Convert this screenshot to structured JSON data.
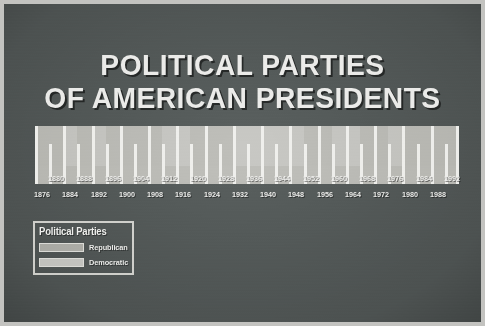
{
  "poster": {
    "title_line_1": "POLITICAL PARTIES",
    "title_line_2": "OF AMERICAN PRESIDENTS",
    "background_color": "#575d5c",
    "border_color": "#c3c3c0",
    "text_color": "#ececea"
  },
  "legend": {
    "title": "Political Parties",
    "items": [
      {
        "label": "Republican",
        "color": "#b2b2ad"
      },
      {
        "label": "Democratic",
        "color": "#c8c8c4"
      }
    ]
  },
  "axis": {
    "upper_years": [
      "1880",
      "1888",
      "1896",
      "1904",
      "1912",
      "1920",
      "1928",
      "1936",
      "1944",
      "1952",
      "1960",
      "1968",
      "1976",
      "1984",
      "1992"
    ],
    "lower_years": [
      "1876",
      "1884",
      "1892",
      "1900",
      "1908",
      "1916",
      "1924",
      "1932",
      "1940",
      "1948",
      "1956",
      "1964",
      "1972",
      "1980",
      "1988"
    ]
  },
  "chart_data": {
    "type": "bar",
    "title": "POLITICAL PARTIES OF AMERICAN PRESIDENTS",
    "xlabel": "",
    "ylabel": "",
    "orientation": "horizontal-timeline",
    "xlim": [
      1876,
      1992
    ],
    "grid": false,
    "legend_position": "bottom-left",
    "categories": [
      "1876",
      "1880",
      "1884",
      "1888",
      "1892",
      "1896",
      "1900",
      "1904",
      "1908",
      "1912",
      "1916",
      "1920",
      "1924",
      "1928",
      "1932",
      "1936",
      "1940",
      "1944",
      "1948",
      "1952",
      "1956",
      "1960",
      "1964",
      "1968",
      "1972",
      "1976",
      "1980",
      "1984",
      "1988",
      "1992"
    ],
    "values": [
      4,
      4,
      4,
      4,
      4,
      4,
      4,
      4,
      4,
      4,
      4,
      4,
      4,
      4,
      4,
      4,
      4,
      4,
      4,
      4,
      4,
      4,
      4,
      4,
      4,
      4,
      4,
      4,
      4,
      4
    ],
    "series": [
      {
        "name": "Party of the administration per 4-year term",
        "values": [
          "Republican",
          "Republican",
          "Democratic",
          "Republican",
          "Democratic",
          "Republican",
          "Republican",
          "Republican",
          "Republican",
          "Democratic",
          "Democratic",
          "Republican",
          "Republican",
          "Republican",
          "Democratic",
          "Democratic",
          "Democratic",
          "Democratic",
          "Democratic",
          "Republican",
          "Republican",
          "Democratic",
          "Democratic",
          "Republican",
          "Republican",
          "Democratic",
          "Republican",
          "Republican",
          "Republican",
          "Republican"
        ]
      }
    ],
    "ticks_major_years": [
      "1880",
      "1888",
      "1896",
      "1904",
      "1912",
      "1920",
      "1928",
      "1936",
      "1944",
      "1952",
      "1960",
      "1968",
      "1976",
      "1984",
      "1992"
    ],
    "ticks_minor_years": [
      "1876",
      "1884",
      "1892",
      "1900",
      "1908",
      "1916",
      "1924",
      "1932",
      "1940",
      "1948",
      "1956",
      "1964",
      "1972",
      "1980",
      "1988"
    ]
  }
}
